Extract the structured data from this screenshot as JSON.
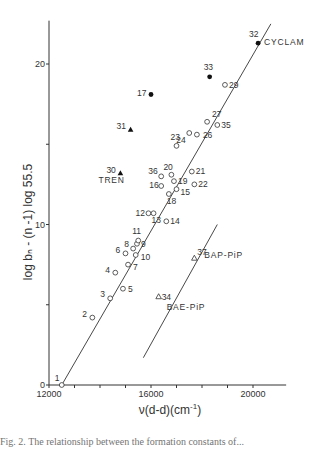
{
  "chart_data": {
    "type": "scatter",
    "title": "",
    "xlabel": "ν(d-d)(cm⁻¹)",
    "ylabel": "log b_n - (n-1) log 55.5",
    "xlim": [
      12000,
      21000
    ],
    "ylim": [
      0,
      22
    ],
    "x_ticks": [
      12000,
      16000,
      20000
    ],
    "x_minor_ticks": [
      13000,
      14000,
      15000,
      17000,
      18000,
      19000
    ],
    "y_ticks": [
      0,
      10,
      20
    ],
    "y_minor_ticks": [
      5,
      15
    ],
    "grid": false,
    "series": [
      {
        "name": "open circles",
        "marker": "open-circle",
        "points": [
          {
            "label": "1",
            "x": 12500,
            "y": 0.0
          },
          {
            "label": "2",
            "x": 13700,
            "y": 4.2
          },
          {
            "label": "3",
            "x": 14400,
            "y": 5.4
          },
          {
            "label": "4",
            "x": 14600,
            "y": 7.0
          },
          {
            "label": "5",
            "x": 14900,
            "y": 6.0
          },
          {
            "label": "6",
            "x": 15000,
            "y": 8.2
          },
          {
            "label": "7",
            "x": 15100,
            "y": 7.5
          },
          {
            "label": "8",
            "x": 15300,
            "y": 8.5
          },
          {
            "label": "9",
            "x": 15450,
            "y": 8.8
          },
          {
            "label": "10",
            "x": 15400,
            "y": 8.1
          },
          {
            "label": "11",
            "x": 15500,
            "y": 9.0
          },
          {
            "label": "12",
            "x": 15900,
            "y": 10.7
          },
          {
            "label": "13",
            "x": 16100,
            "y": 10.7
          },
          {
            "label": "14",
            "x": 16600,
            "y": 10.2
          },
          {
            "label": "15",
            "x": 17000,
            "y": 12.2
          },
          {
            "label": "16",
            "x": 16400,
            "y": 12.4
          },
          {
            "label": "18",
            "x": 16700,
            "y": 11.9
          },
          {
            "label": "19",
            "x": 16900,
            "y": 12.7
          },
          {
            "label": "20",
            "x": 16800,
            "y": 13.1
          },
          {
            "label": "21",
            "x": 17600,
            "y": 13.3
          },
          {
            "label": "22",
            "x": 17700,
            "y": 12.5
          },
          {
            "label": "23",
            "x": 17000,
            "y": 14.9
          },
          {
            "label": "24",
            "x": 17500,
            "y": 15.7
          },
          {
            "label": "26",
            "x": 17800,
            "y": 15.6
          },
          {
            "label": "27",
            "x": 18200,
            "y": 16.4
          },
          {
            "label": "29",
            "x": 18900,
            "y": 18.7
          },
          {
            "label": "35",
            "x": 18600,
            "y": 16.2
          },
          {
            "label": "36",
            "x": 16400,
            "y": 13.0
          }
        ]
      },
      {
        "name": "filled circles",
        "marker": "filled-circle",
        "points": [
          {
            "label": "17",
            "x": 16000,
            "y": 18.1
          },
          {
            "label": "32",
            "x": 20200,
            "y": 21.3,
            "annotation": "CYCLAM"
          },
          {
            "label": "33",
            "x": 18300,
            "y": 19.2
          }
        ]
      },
      {
        "name": "filled triangles",
        "marker": "filled-triangle",
        "points": [
          {
            "label": "30",
            "x": 14800,
            "y": 13.2,
            "annotation": "TREN"
          },
          {
            "label": "31",
            "x": 15200,
            "y": 15.9
          }
        ]
      },
      {
        "name": "open triangles",
        "marker": "open-triangle",
        "points": [
          {
            "label": "34",
            "x": 16300,
            "y": 5.5,
            "annotation": "BAE-PiP"
          },
          {
            "label": "37",
            "x": 17700,
            "y": 7.9,
            "annotation": "BAP-PiP"
          }
        ]
      }
    ],
    "fit_lines": [
      {
        "name": "main regression",
        "x": [
          12500,
          20700
        ],
        "y": [
          0.0,
          22.5
        ]
      },
      {
        "name": "piperazine line",
        "x": [
          15700,
          18600
        ],
        "y": [
          1.7,
          10.0
        ]
      }
    ],
    "annotations": [
      "CYCLAM",
      "TREN",
      "BAP-PiP",
      "BAE-PiP"
    ]
  },
  "axes": {
    "x_tick_labels": [
      "12000",
      "16000",
      "20000"
    ],
    "y_tick_labels": [
      "0",
      "10",
      "20"
    ],
    "xlabel_main": "ν(d-d)(cm",
    "xlabel_sup": "-1",
    "xlabel_end": ")",
    "ylabel": "log  bₙ - (n -1) log 55.5"
  },
  "caption": "Fig. 2. The relationship between the formation constants of..."
}
